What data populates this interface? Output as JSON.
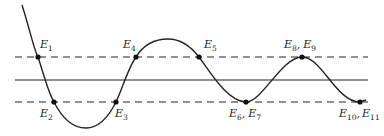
{
  "diagram": {
    "colors": {
      "line": "#222222",
      "background": "#ffffff"
    },
    "reference_lines": [
      {
        "name": "upper-threshold",
        "style": "dashed",
        "y": 57
      },
      {
        "name": "center-line",
        "style": "solid",
        "y": 80
      },
      {
        "name": "lower-threshold",
        "style": "dashed",
        "y": 102
      }
    ],
    "points": [
      {
        "id": "E1",
        "base": "E",
        "sub": "1",
        "x": 38,
        "y": 57
      },
      {
        "id": "E2",
        "base": "E",
        "sub": "2",
        "x": 54,
        "y": 102
      },
      {
        "id": "E3",
        "base": "E",
        "sub": "3",
        "x": 116,
        "y": 102
      },
      {
        "id": "E4",
        "base": "E",
        "sub": "4",
        "x": 136,
        "y": 57
      },
      {
        "id": "E5",
        "base": "E",
        "sub": "5",
        "x": 199,
        "y": 57
      },
      {
        "id": "E6E7",
        "base": "E",
        "sub": "6",
        "base2": "E",
        "sub2": "7",
        "x": 246,
        "y": 102
      },
      {
        "id": "E8E9",
        "base": "E",
        "sub": "8",
        "base2": "E",
        "sub2": "9",
        "x": 302,
        "y": 57
      },
      {
        "id": "E10E11",
        "base": "E",
        "sub": "10",
        "base2": "E",
        "sub2": "11",
        "x": 360,
        "y": 102
      }
    ],
    "labels": {
      "E1": {
        "base": "E",
        "sub": "1"
      },
      "E2": {
        "base": "E",
        "sub": "2"
      },
      "E3": {
        "base": "E",
        "sub": "3"
      },
      "E4": {
        "base": "E",
        "sub": "4"
      },
      "E5": {
        "base": "E",
        "sub": "5"
      },
      "E6": {
        "base": "E",
        "sub": "6"
      },
      "E7": {
        "base": "E",
        "sub": "7"
      },
      "E8": {
        "base": "E",
        "sub": "8"
      },
      "E9": {
        "base": "E",
        "sub": "9"
      },
      "E10": {
        "base": "E",
        "sub": "10"
      },
      "E11": {
        "base": "E",
        "sub": "11"
      },
      "sep": ","
    }
  }
}
